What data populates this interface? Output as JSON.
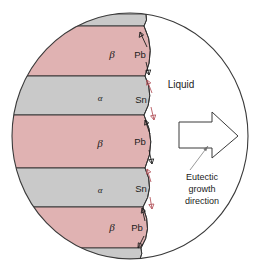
{
  "figure": {
    "type": "materials-science-diagram",
    "canvas": {
      "width": 260,
      "height": 270
    },
    "background_color": "#ffffff"
  },
  "colors": {
    "beta_phase": "#e0b2b2",
    "alpha_phase": "#c9c9c9",
    "liquid": "#ffffff",
    "outline": "#3a3a3a",
    "band_edge": "#2e2e2e",
    "pb_arrow": "#1d1d1d",
    "sn_arrow": "#b4575f",
    "leader_line": "#6f6f6f",
    "text": "#1b1b1b"
  },
  "solid_region": {
    "name": "solidified eutectic lamellae",
    "bands": [
      {
        "id": "sliver-top",
        "phase": "alpha",
        "label": "",
        "fill": "#c9c9c9",
        "y_top": 14,
        "y_bottom": 26
      },
      {
        "id": "band-1",
        "phase": "beta",
        "label": "β",
        "fill": "#e0b2b2",
        "y_top": 26,
        "y_bottom": 76,
        "label_x": 112,
        "label_y": 55
      },
      {
        "id": "band-2",
        "phase": "alpha",
        "label": "α",
        "fill": "#c9c9c9",
        "y_top": 76,
        "y_bottom": 115,
        "label_x": 100,
        "label_y": 98
      },
      {
        "id": "band-3",
        "phase": "beta",
        "label": "β",
        "fill": "#e0b2b2",
        "y_top": 115,
        "y_bottom": 168,
        "label_x": 100,
        "label_y": 144
      },
      {
        "id": "band-4",
        "phase": "alpha",
        "label": "α",
        "fill": "#c9c9c9",
        "y_top": 168,
        "y_bottom": 207,
        "label_x": 100,
        "label_y": 190
      },
      {
        "id": "band-5",
        "phase": "beta",
        "label": "β",
        "fill": "#e0b2b2",
        "y_top": 207,
        "y_bottom": 248,
        "label_x": 112,
        "label_y": 228
      },
      {
        "id": "sliver-bottom",
        "phase": "alpha",
        "label": "",
        "fill": "#c9c9c9",
        "y_top": 248,
        "y_bottom": 258
      }
    ]
  },
  "liquid_region": {
    "label": "Liquid",
    "label_x": 180,
    "label_y": 84
  },
  "diffusion_labels": [
    {
      "id": "pb-top",
      "text": "Pb",
      "x": 140,
      "y": 55,
      "species": "lead",
      "arrow_color": "#1d1d1d"
    },
    {
      "id": "sn-upper",
      "text": "Sn",
      "x": 140,
      "y": 100,
      "species": "tin",
      "arrow_color": "#b4575f"
    },
    {
      "id": "pb-middle",
      "text": "Pb",
      "x": 140,
      "y": 142,
      "species": "lead",
      "arrow_color": "#1d1d1d"
    },
    {
      "id": "sn-lower",
      "text": "Sn",
      "x": 140,
      "y": 190,
      "species": "tin",
      "arrow_color": "#b4575f"
    },
    {
      "id": "pb-bottom",
      "text": "Pb",
      "x": 140,
      "y": 228,
      "species": "lead",
      "arrow_color": "#1d1d1d"
    }
  ],
  "growth_arrow": {
    "name": "eutectic-growth-arrow",
    "direction": "right",
    "fill": "#ffffff",
    "caption_lines": [
      "Eutectic",
      "growth",
      "direction"
    ],
    "caption_x": 202,
    "caption_y_start": 175,
    "caption_line_height": 12
  }
}
